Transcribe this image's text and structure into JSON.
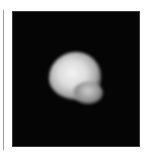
{
  "image": {
    "subject": "bright irregular object on black background",
    "background_color": "#050505",
    "object_color": "#e6e6e6"
  }
}
